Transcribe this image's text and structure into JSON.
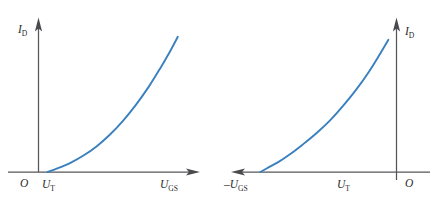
{
  "figure": {
    "background_color": "#ffffff",
    "curve_color": "#3A80BE",
    "axis_color": "#56565a",
    "text_color": "#2b2b2d"
  },
  "left_plot": {
    "name": "n-channel enhancement MOSFET transfer characteristic",
    "y_axis_label_main": "I",
    "y_axis_label_sub": "D",
    "x_axis_label_main": "U",
    "x_axis_label_sub": "GS",
    "origin_label": "O",
    "threshold_label_main": "U",
    "threshold_label_sub": "T",
    "x_axis_direction": "right",
    "curve_shape": "increasing-convex"
  },
  "right_plot": {
    "name": "p-channel enhancement MOSFET transfer characteristic",
    "y_axis_label_main": "I",
    "y_axis_label_sub": "D",
    "x_axis_label_prefix": "–",
    "x_axis_label_main": "U",
    "x_axis_label_sub": "GS",
    "origin_label": "O",
    "threshold_label_main": "U",
    "threshold_label_sub": "T",
    "x_axis_direction": "left",
    "curve_shape": "decreasing-convex"
  },
  "chart_data": {
    "type": "line",
    "panels": [
      {
        "name": "left",
        "xlabel": "U_GS",
        "ylabel": "I_D",
        "origin_label": "O",
        "threshold_label": "U_T",
        "axis_arrow_x": "right",
        "axis_arrow_y": "up",
        "grid": false,
        "legend": "none",
        "xlim": [
          0,
          10
        ],
        "ylim": [
          0,
          10
        ],
        "series": [
          {
            "name": "I_D",
            "color": "#3A80BE",
            "x": [
              0.55,
              1.2,
              2.0,
              2.8,
              3.6,
              4.4,
              5.2,
              6.0,
              6.8,
              7.5,
              8.1,
              8.6
            ],
            "y": [
              0.0,
              0.25,
              0.62,
              1.1,
              1.7,
              2.45,
              3.35,
              4.4,
              5.6,
              6.8,
              7.9,
              8.9
            ]
          }
        ]
      },
      {
        "name": "right",
        "xlabel": "-U_GS",
        "ylabel": "I_D",
        "origin_label": "O",
        "threshold_label": "U_T",
        "axis_arrow_x": "left",
        "axis_arrow_y": "up",
        "grid": false,
        "legend": "none",
        "xlim": [
          0,
          10
        ],
        "ylim": [
          0,
          10
        ],
        "series": [
          {
            "name": "I_D",
            "color": "#3A80BE",
            "x": [
              0.5,
              1.0,
              1.7,
              2.5,
              3.3,
              4.1,
              5.0,
              5.8,
              6.6,
              7.3,
              7.9,
              8.4
            ],
            "y": [
              8.7,
              7.8,
              6.6,
              5.4,
              4.35,
              3.4,
              2.5,
              1.8,
              1.15,
              0.65,
              0.3,
              0.0
            ]
          }
        ]
      }
    ]
  }
}
